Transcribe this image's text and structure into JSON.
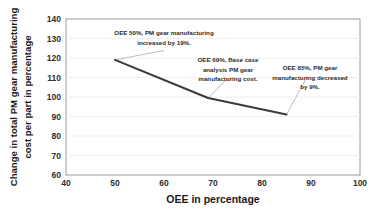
{
  "chart_data": {
    "type": "line",
    "title": "",
    "subtitle": "",
    "xlabel": "OEE in percentage",
    "ylabel": "Change in total PM gear manufacturing cost per part in percentage",
    "ylabel_line1": "Change in total PM gear manufacturing",
    "ylabel_line2": "cost per part in percentage",
    "xlim": [
      40,
      100
    ],
    "ylim": [
      60,
      140
    ],
    "xticks": [
      40,
      50,
      60,
      70,
      80,
      90,
      100
    ],
    "yticks": [
      60,
      70,
      80,
      90,
      100,
      110,
      120,
      130,
      140
    ],
    "xtick_labels": [
      "40",
      "50",
      "60",
      "70",
      "80",
      "90",
      "100"
    ],
    "ytick_labels": [
      "60",
      "70",
      "80",
      "90",
      "100",
      "110",
      "120",
      "130",
      "140"
    ],
    "grid": "horizontal",
    "legend": "none",
    "line_color": "#3b3b3b",
    "x": [
      50,
      69,
      85
    ],
    "values": [
      119,
      99.5,
      91
    ],
    "series": [
      {
        "name": "PM gear manufacturing cost change",
        "x": [
          50,
          69,
          85
        ],
        "values": [
          119,
          99.5,
          91
        ]
      }
    ],
    "annotations": [
      {
        "id": "annotation-oee-50",
        "line1": "OEE 50%, PM gear manufacturing",
        "line2": "increased by 19%.",
        "line3": "",
        "point_x": 50,
        "point_y": 119
      },
      {
        "id": "annotation-oee-69",
        "line1": "OEE 69%, Base case",
        "line2": "analysis PM gear",
        "line3": "manufacturing cost.",
        "point_x": 69,
        "point_y": 99.5
      },
      {
        "id": "annotation-oee-85",
        "line1": "OEE 85%, PM gear",
        "line2": "manufacturing decreased",
        "line3": "by 9%.",
        "point_x": 85,
        "point_y": 91
      }
    ]
  }
}
